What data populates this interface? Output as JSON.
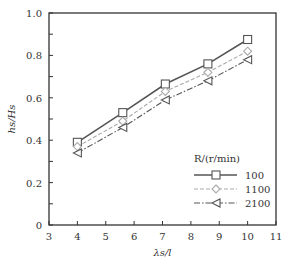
{
  "chart_data": {
    "type": "line",
    "title": "",
    "xlabel": "λs/l",
    "ylabel": "hs/Hs",
    "xlim": [
      3,
      11
    ],
    "ylim": [
      0,
      1.0
    ],
    "xticks": [
      3,
      4,
      5,
      6,
      7,
      8,
      9,
      10,
      11
    ],
    "yticks": [
      0,
      0.2,
      0.4,
      0.6,
      0.8,
      1.0
    ],
    "ytick_labels": [
      "0",
      "0.2",
      "0.4",
      "0.6",
      "0.8",
      "1.0"
    ],
    "grid": false,
    "legend": {
      "title": "R/(r/min)",
      "position": "lower right"
    },
    "series": [
      {
        "name": "100",
        "marker": "square",
        "line": "solid",
        "color": "#555555",
        "x": [
          4,
          5.6,
          7.1,
          8.6,
          10
        ],
        "y": [
          0.39,
          0.53,
          0.665,
          0.76,
          0.875
        ]
      },
      {
        "name": "1100",
        "marker": "diamond",
        "line": "dashed",
        "color": "#aaaaaa",
        "x": [
          4,
          5.6,
          7.1,
          8.6,
          10
        ],
        "y": [
          0.37,
          0.49,
          0.63,
          0.72,
          0.82
        ]
      },
      {
        "name": "2100",
        "marker": "triangle-left",
        "line": "dashdot",
        "color": "#555555",
        "x": [
          4,
          5.6,
          7.1,
          8.6,
          10
        ],
        "y": [
          0.34,
          0.46,
          0.59,
          0.68,
          0.78
        ]
      }
    ]
  }
}
